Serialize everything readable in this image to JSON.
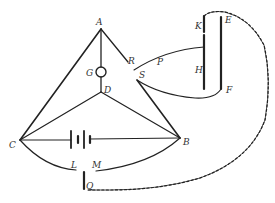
{
  "diagram": {
    "type": "electric-circuit",
    "colors": {
      "line": "#222222",
      "label": "#333333",
      "background": "#ffffff"
    },
    "labels": {
      "A": "A",
      "B": "B",
      "C": "C",
      "D": "D",
      "G": "G",
      "R": "R",
      "S": "S",
      "P": "P",
      "K": "K",
      "E": "E",
      "H": "H",
      "F": "F",
      "L": "L",
      "M": "M",
      "Q": "Q"
    },
    "components": [
      {
        "id": "galvanometer",
        "label": "G",
        "icon": "circle"
      },
      {
        "id": "battery",
        "icon": "battery-cells"
      },
      {
        "id": "plate-KH",
        "labels": [
          "K",
          "H"
        ]
      },
      {
        "id": "plate-EF",
        "labels": [
          "E",
          "F"
        ]
      },
      {
        "id": "terminal-Q",
        "label": "Q"
      }
    ]
  }
}
